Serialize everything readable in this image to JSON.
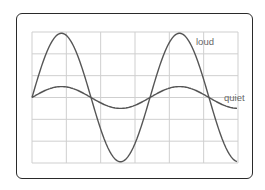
{
  "diagram": {
    "type": "oscilloscope-waveform-comparison",
    "grid": {
      "columns": 6,
      "rows": 6,
      "line_color": "#cfcfcf"
    },
    "waves": [
      {
        "name": "loud",
        "label": "loud",
        "amplitude_divisions": 3,
        "color": "#555555"
      },
      {
        "name": "quiet",
        "label": "quiet",
        "amplitude_divisions": 0.5,
        "color": "#555555"
      }
    ]
  },
  "labels": {
    "loud": "loud",
    "quiet": "quiet"
  },
  "colors": {
    "frame": "#2a2a2a",
    "wave": "#555555",
    "grid": "#cfcfcf",
    "text": "#666666"
  }
}
